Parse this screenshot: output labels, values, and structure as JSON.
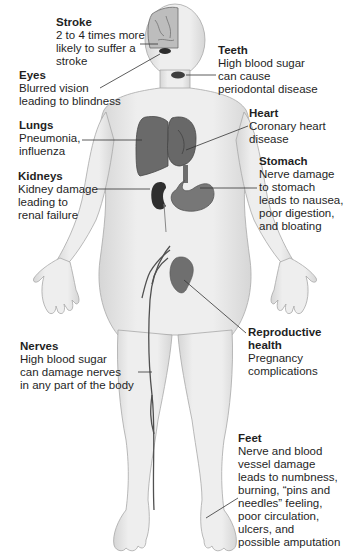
{
  "diagram": {
    "colors": {
      "skin": "#e9e9e9",
      "skin_shade": "#cfcfcf",
      "outline": "#a8a8a8",
      "organ_dark": "#5e5e5e",
      "organ_mid": "#777777",
      "leader_line": "#333333",
      "text": "#1f1f1f"
    },
    "callouts": [
      {
        "id": "stroke",
        "title": "Stroke",
        "description": "2 to 4 times more\nlikely to suffer a\nstroke"
      },
      {
        "id": "eyes",
        "title": "Eyes",
        "description": "Blurred vision\nleading to blindness"
      },
      {
        "id": "teeth",
        "title": "Teeth",
        "description": "High blood sugar\ncan cause\nperiodontal disease"
      },
      {
        "id": "lungs",
        "title": "Lungs",
        "description": "Pneumonia,\ninfluenza"
      },
      {
        "id": "heart",
        "title": "Heart",
        "description": "Coronary heart\ndisease"
      },
      {
        "id": "kidneys",
        "title": "Kidneys",
        "description": "Kidney damage\nleading to\nrenal failure"
      },
      {
        "id": "stomach",
        "title": "Stomach",
        "description": "Nerve damage\nto stomach\nleads to nausea,\npoor digestion,\nand bloating"
      },
      {
        "id": "reproductive",
        "title": "Reproductive\nhealth",
        "description": "Pregnancy\ncomplications"
      },
      {
        "id": "nerves",
        "title": "Nerves",
        "description": "High blood sugar\ncan damage nerves\nin any part of the body"
      },
      {
        "id": "feet",
        "title": "Feet",
        "description": "Nerve  and blood\nvessel damage\nleads to numbness,\nburning, “pins and\nneedles” feeling,\npoor circulation,\nulcers, and\npossible amputation"
      }
    ]
  }
}
